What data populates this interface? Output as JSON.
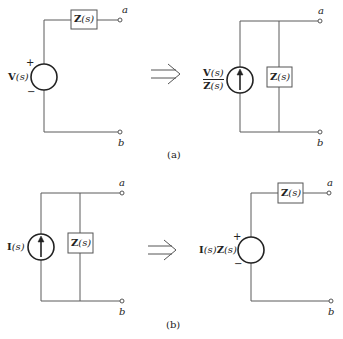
{
  "panel_a": {
    "caption": "(a)",
    "left": {
      "source_label_bold": "V",
      "source_label_arg": "(s)",
      "plus": "+",
      "minus": "−",
      "impedance_bold": "Z",
      "impedance_arg": "(s)",
      "terminal_top": "a",
      "terminal_bottom": "b"
    },
    "right": {
      "numerator_bold": "V",
      "numerator_arg": "(s)",
      "denominator_bold": "Z",
      "denominator_arg": "(s)",
      "impedance_bold": "Z",
      "impedance_arg": "(s)",
      "terminal_top": "a",
      "terminal_bottom": "b"
    },
    "arrow": "implies"
  },
  "panel_b": {
    "caption": "(b)",
    "left": {
      "source_label_bold": "I",
      "source_label_arg": "(s)",
      "impedance_bold": "Z",
      "impedance_arg": "(s)",
      "terminal_top": "a",
      "terminal_bottom": "b"
    },
    "right": {
      "source_label_bold1": "I",
      "source_label_arg1": "(s)",
      "source_label_bold2": "Z",
      "source_label_arg2": "(s)",
      "plus": "+",
      "minus": "−",
      "impedance_bold": "Z",
      "impedance_arg": "(s)",
      "terminal_top": "a",
      "terminal_bottom": "b"
    },
    "arrow": "implies"
  },
  "colors": {
    "line": "#555555",
    "stroke_dark": "#222222"
  }
}
